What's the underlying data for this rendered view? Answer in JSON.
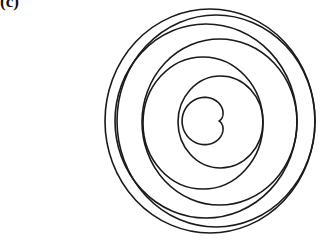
{
  "panel": {
    "label": "(c)"
  },
  "figure": {
    "stroke_color": "#1a1a1a",
    "stroke_width": 1.6,
    "background": "#ffffff",
    "cardioid": {
      "cusp_x": 218.5,
      "cusp_y": 121,
      "a": 18.2,
      "y_scale": 1.0,
      "orientation": "cusp-right"
    },
    "rings": [
      {
        "cx": 220.5,
        "cy": 122,
        "rx": 42.5,
        "ry": 46
      },
      {
        "cx": 203,
        "cy": 123,
        "rx": 60,
        "ry": 66
      },
      {
        "cx": 219.5,
        "cy": 122,
        "rx": 77.5,
        "ry": 83
      },
      {
        "cx": 206,
        "cy": 121,
        "rx": 91,
        "ry": 97
      },
      {
        "cx": 216,
        "cy": 121,
        "rx": 99,
        "ry": 106
      },
      {
        "cx": 210,
        "cy": 121,
        "rx": 105,
        "ry": 112
      }
    ]
  }
}
